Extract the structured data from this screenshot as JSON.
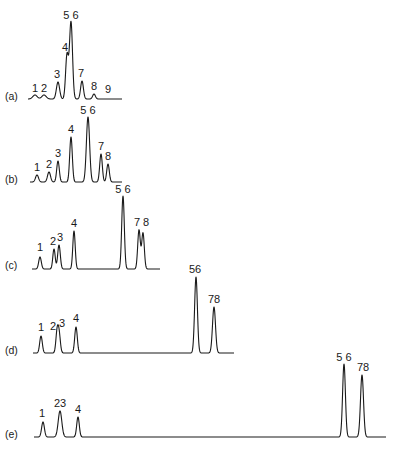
{
  "chart_data": {
    "type": "line",
    "title": "",
    "xlabel": "",
    "ylabel": "",
    "grid": false,
    "legend": "none",
    "panels": [
      {
        "id": "a",
        "label": "(a)",
        "label_pos": [
          5,
          97
        ],
        "baseline_y": 99,
        "x_start": 28,
        "x_end": 122,
        "peaks": [
          {
            "label": "1",
            "x": 35,
            "top": 95,
            "w": 2.2,
            "label_x": 35,
            "label_y": 92
          },
          {
            "label": "2",
            "x": 44,
            "top": 95,
            "w": 2.2,
            "label_x": 44,
            "label_y": 92
          },
          {
            "label": "3",
            "x": 58,
            "top": 82,
            "w": 1.6,
            "label_x": 57,
            "label_y": 78
          },
          {
            "label": "4",
            "x": 67,
            "top": 55,
            "w": 1.4,
            "label_x": 65,
            "label_y": 51
          },
          {
            "label": "5 6",
            "x": 71,
            "top": 22,
            "w": 1.5,
            "label_x": 71,
            "label_y": 19
          },
          {
            "label": "7",
            "x": 82,
            "top": 81,
            "w": 1.4,
            "label_x": 81,
            "label_y": 77
          },
          {
            "label": "8",
            "x": 94,
            "top": 94,
            "w": 1.4,
            "label_x": 94,
            "label_y": 90
          },
          {
            "label": "9",
            "x": 108,
            "top": 99,
            "w": 2.0,
            "label_x": 108,
            "label_y": 93
          }
        ]
      },
      {
        "id": "b",
        "label": "(b)",
        "label_pos": [
          5,
          180
        ],
        "baseline_y": 182,
        "x_start": 30,
        "x_end": 122,
        "peaks": [
          {
            "label": "1",
            "x": 37,
            "top": 175,
            "w": 1.5,
            "label_x": 37,
            "label_y": 171
          },
          {
            "label": "2",
            "x": 49,
            "top": 172,
            "w": 1.5,
            "label_x": 49,
            "label_y": 168
          },
          {
            "label": "3",
            "x": 58,
            "top": 161,
            "w": 1.3,
            "label_x": 58,
            "label_y": 157
          },
          {
            "label": "4",
            "x": 71,
            "top": 137,
            "w": 1.3,
            "label_x": 71,
            "label_y": 133
          },
          {
            "label": "5 6",
            "x": 88,
            "top": 117,
            "w": 1.6,
            "label_x": 88,
            "label_y": 114
          },
          {
            "label": "7",
            "x": 101,
            "top": 154,
            "w": 1.3,
            "label_x": 101,
            "label_y": 150
          },
          {
            "label": "8",
            "x": 108,
            "top": 164,
            "w": 1.3,
            "label_x": 108,
            "label_y": 160
          }
        ]
      },
      {
        "id": "c",
        "label": "(c)",
        "label_pos": [
          5,
          266
        ],
        "baseline_y": 269,
        "x_start": 32,
        "x_end": 160,
        "peaks": [
          {
            "label": "1",
            "x": 40,
            "top": 257,
            "w": 1.3,
            "label_x": 40,
            "label_y": 251
          },
          {
            "label": "2",
            "x": 54,
            "top": 249,
            "w": 1.2,
            "label_x": 53,
            "label_y": 245
          },
          {
            "label": "3",
            "x": 59,
            "top": 245,
            "w": 1.3,
            "label_x": 60,
            "label_y": 241
          },
          {
            "label": "4",
            "x": 74,
            "top": 231,
            "w": 1.2,
            "label_x": 74,
            "label_y": 227
          },
          {
            "label": "5 6",
            "x": 123,
            "top": 196,
            "w": 1.3,
            "label_x": 123,
            "label_y": 193
          },
          {
            "label": "7",
            "x": 139,
            "top": 230,
            "w": 1.3,
            "label_x": 137,
            "label_y": 226
          },
          {
            "label": "8",
            "x": 143,
            "top": 233,
            "w": 1.3,
            "label_x": 146,
            "label_y": 226
          }
        ]
      },
      {
        "id": "d",
        "label": "(d)",
        "label_pos": [
          5,
          351
        ],
        "baseline_y": 353,
        "x_start": 33,
        "x_end": 234,
        "peaks": [
          {
            "label": "1",
            "x": 41,
            "top": 336,
            "w": 1.3,
            "label_x": 41,
            "label_y": 331
          },
          {
            "label": "2",
            "x": 57,
            "top": 334,
            "w": 1.2,
            "label_x": 53,
            "label_y": 330
          },
          {
            "label": "3",
            "x": 59,
            "top": 333,
            "w": 1.3,
            "label_x": 62,
            "label_y": 327
          },
          {
            "label": "4",
            "x": 76,
            "top": 327,
            "w": 1.3,
            "label_x": 76,
            "label_y": 322
          },
          {
            "label": "56",
            "x": 196,
            "top": 277,
            "w": 1.4,
            "label_x": 195,
            "label_y": 273
          },
          {
            "label": "78",
            "x": 214,
            "top": 307,
            "w": 1.5,
            "label_x": 214,
            "label_y": 303
          }
        ]
      },
      {
        "id": "e",
        "label": "(e)",
        "label_pos": [
          5,
          435
        ],
        "baseline_y": 437,
        "x_start": 34,
        "x_end": 386,
        "peaks": [
          {
            "label": "1",
            "x": 43,
            "top": 422,
            "w": 1.4,
            "label_x": 42,
            "label_y": 417
          },
          {
            "label": "23",
            "x": 60,
            "top": 411,
            "w": 1.8,
            "label_x": 60,
            "label_y": 407
          },
          {
            "label": "4",
            "x": 78,
            "top": 417,
            "w": 1.3,
            "label_x": 78,
            "label_y": 413
          },
          {
            "label": "5 6",
            "x": 344,
            "top": 364,
            "w": 1.4,
            "label_x": 344,
            "label_y": 361
          },
          {
            "label": "78",
            "x": 362,
            "top": 375,
            "w": 1.5,
            "label_x": 363,
            "label_y": 371
          }
        ]
      }
    ]
  }
}
